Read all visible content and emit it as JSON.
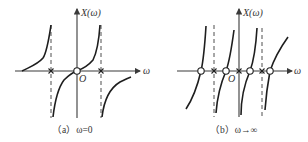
{
  "panels": [
    {
      "id": "a",
      "y_axis_label": "X(ω)",
      "x_axis_label": "ω",
      "origin_label": "O",
      "caption": "（a）ω=0",
      "zeros": 1,
      "poles": 2
    },
    {
      "id": "b",
      "y_axis_label": "X(ω)",
      "x_axis_label": "ω",
      "origin_label": "O",
      "caption": "（b）ω→∞",
      "zeros": 4,
      "poles": 3
    }
  ],
  "legend": {
    "zero_marker": "circle",
    "pole_marker": "cross"
  }
}
